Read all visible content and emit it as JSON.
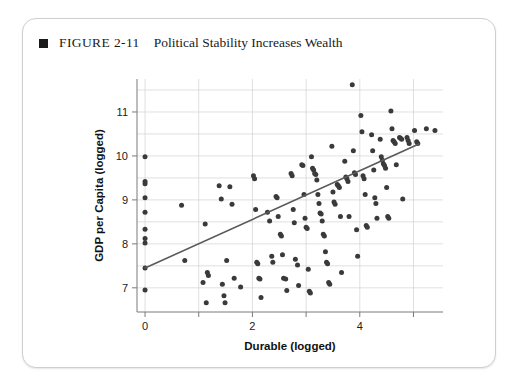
{
  "figure": {
    "bullet_icon": "square-bullet-icon",
    "number": "FIGURE 2-11",
    "title": "Political Stability Increases Wealth"
  },
  "chart_data": {
    "type": "scatter",
    "title": "Political Stability Increases Wealth",
    "xlabel": "Durable (logged)",
    "ylabel": "GDP per Capita (logged)",
    "xlim": [
      -0.15,
      5.55
    ],
    "ylim": [
      6.45,
      11.75
    ],
    "xticks": [
      0,
      1,
      2,
      3,
      4,
      5
    ],
    "xticklabels": [
      "0",
      "",
      "2",
      "",
      "4",
      ""
    ],
    "yticks": [
      7,
      8,
      9,
      10,
      11
    ],
    "yticklabels": [
      "7",
      "8",
      "9",
      "10",
      "11"
    ],
    "grid": true,
    "grid_x": [
      0,
      1,
      2,
      3,
      4,
      5
    ],
    "grid_y": [
      7,
      7.5,
      8,
      8.5,
      9,
      9.5,
      10,
      10.5,
      11,
      11.5
    ],
    "legend": null,
    "point_color": "#3a3a3a",
    "line_color": "#5a5a5a",
    "grid_color": "#d2d2d2",
    "trendline": {
      "type": "linear-fit",
      "x0": 0.0,
      "y0": 7.45,
      "x1": 5.1,
      "y1": 10.27
    },
    "points": [
      [
        0.0,
        9.98
      ],
      [
        0.0,
        9.42
      ],
      [
        0.0,
        9.37
      ],
      [
        0.0,
        9.05
      ],
      [
        0.0,
        8.72
      ],
      [
        0.0,
        8.33
      ],
      [
        0.0,
        8.12
      ],
      [
        0.0,
        8.02
      ],
      [
        0.0,
        7.45
      ],
      [
        0.0,
        6.95
      ],
      [
        0.68,
        8.88
      ],
      [
        0.74,
        7.62
      ],
      [
        1.08,
        7.12
      ],
      [
        1.12,
        8.45
      ],
      [
        1.14,
        6.66
      ],
      [
        1.16,
        7.35
      ],
      [
        1.18,
        7.28
      ],
      [
        1.38,
        9.32
      ],
      [
        1.42,
        9.02
      ],
      [
        1.44,
        7.08
      ],
      [
        1.47,
        6.82
      ],
      [
        1.49,
        6.66
      ],
      [
        1.52,
        7.62
      ],
      [
        1.58,
        9.3
      ],
      [
        1.62,
        8.9
      ],
      [
        1.66,
        7.22
      ],
      [
        1.78,
        7.02
      ],
      [
        2.02,
        9.55
      ],
      [
        2.04,
        9.48
      ],
      [
        2.06,
        8.78
      ],
      [
        2.08,
        7.58
      ],
      [
        2.1,
        7.55
      ],
      [
        2.12,
        7.22
      ],
      [
        2.14,
        7.2
      ],
      [
        2.16,
        6.78
      ],
      [
        2.28,
        8.72
      ],
      [
        2.32,
        8.52
      ],
      [
        2.36,
        7.72
      ],
      [
        2.38,
        7.58
      ],
      [
        2.44,
        9.08
      ],
      [
        2.46,
        9.05
      ],
      [
        2.48,
        8.62
      ],
      [
        2.52,
        8.22
      ],
      [
        2.54,
        8.18
      ],
      [
        2.56,
        7.75
      ],
      [
        2.58,
        7.22
      ],
      [
        2.62,
        7.2
      ],
      [
        2.64,
        6.94
      ],
      [
        2.72,
        9.6
      ],
      [
        2.74,
        9.55
      ],
      [
        2.76,
        8.78
      ],
      [
        2.78,
        8.48
      ],
      [
        2.8,
        7.65
      ],
      [
        2.84,
        7.52
      ],
      [
        2.86,
        7.05
      ],
      [
        2.92,
        9.8
      ],
      [
        2.94,
        9.78
      ],
      [
        2.96,
        9.12
      ],
      [
        2.98,
        8.58
      ],
      [
        3.0,
        8.38
      ],
      [
        3.02,
        8.35
      ],
      [
        3.04,
        7.42
      ],
      [
        3.06,
        6.92
      ],
      [
        3.08,
        6.88
      ],
      [
        3.1,
        9.98
      ],
      [
        3.12,
        9.72
      ],
      [
        3.14,
        9.68
      ],
      [
        3.16,
        9.6
      ],
      [
        3.18,
        9.58
      ],
      [
        3.2,
        9.45
      ],
      [
        3.22,
        9.12
      ],
      [
        3.24,
        8.92
      ],
      [
        3.26,
        8.7
      ],
      [
        3.28,
        8.68
      ],
      [
        3.3,
        8.52
      ],
      [
        3.32,
        8.22
      ],
      [
        3.34,
        8.18
      ],
      [
        3.36,
        7.82
      ],
      [
        3.38,
        7.58
      ],
      [
        3.4,
        7.55
      ],
      [
        3.42,
        7.12
      ],
      [
        3.44,
        7.08
      ],
      [
        3.48,
        10.22
      ],
      [
        3.5,
        9.18
      ],
      [
        3.52,
        8.95
      ],
      [
        3.54,
        8.9
      ],
      [
        3.58,
        9.35
      ],
      [
        3.6,
        9.32
      ],
      [
        3.62,
        9.28
      ],
      [
        3.64,
        8.62
      ],
      [
        3.66,
        7.35
      ],
      [
        3.72,
        9.88
      ],
      [
        3.74,
        9.52
      ],
      [
        3.76,
        9.48
      ],
      [
        3.78,
        9.42
      ],
      [
        3.8,
        8.62
      ],
      [
        3.86,
        11.62
      ],
      [
        3.88,
        10.12
      ],
      [
        3.9,
        9.62
      ],
      [
        3.92,
        9.58
      ],
      [
        3.94,
        8.32
      ],
      [
        3.96,
        7.72
      ],
      [
        4.02,
        10.92
      ],
      [
        4.04,
        10.55
      ],
      [
        4.06,
        9.55
      ],
      [
        4.08,
        9.48
      ],
      [
        4.1,
        9.12
      ],
      [
        4.12,
        8.42
      ],
      [
        4.14,
        8.38
      ],
      [
        4.22,
        10.48
      ],
      [
        4.24,
        10.12
      ],
      [
        4.26,
        9.68
      ],
      [
        4.28,
        9.05
      ],
      [
        4.3,
        8.92
      ],
      [
        4.32,
        8.58
      ],
      [
        4.38,
        10.38
      ],
      [
        4.4,
        9.98
      ],
      [
        4.42,
        9.9
      ],
      [
        4.44,
        9.82
      ],
      [
        4.46,
        9.78
      ],
      [
        4.48,
        9.72
      ],
      [
        4.5,
        9.28
      ],
      [
        4.52,
        8.62
      ],
      [
        4.54,
        8.58
      ],
      [
        4.58,
        11.02
      ],
      [
        4.6,
        10.62
      ],
      [
        4.62,
        10.35
      ],
      [
        4.64,
        10.32
      ],
      [
        4.66,
        10.28
      ],
      [
        4.68,
        9.8
      ],
      [
        4.74,
        10.42
      ],
      [
        4.76,
        10.4
      ],
      [
        4.78,
        10.38
      ],
      [
        4.8,
        9.02
      ],
      [
        4.88,
        10.42
      ],
      [
        4.9,
        10.35
      ],
      [
        4.92,
        10.28
      ],
      [
        5.02,
        10.58
      ],
      [
        5.06,
        10.32
      ],
      [
        5.08,
        10.28
      ],
      [
        5.24,
        10.62
      ],
      [
        5.4,
        10.58
      ]
    ]
  }
}
